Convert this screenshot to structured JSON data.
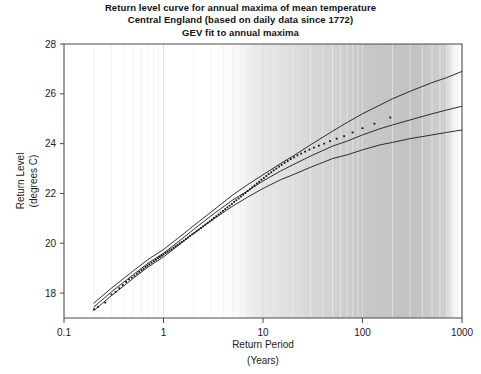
{
  "chart_data": {
    "type": "line",
    "title": "Return level curve for annual maxima of mean temperature",
    "subtitle": "Central England (based on daily data since 1772)",
    "subtitle2": "GEV fit to annual maxima",
    "xlabel": "Return Period",
    "xlabel_units": "(Years)",
    "ylabel_line1": "Return Level",
    "ylabel_line2": "(degrees C)",
    "xscale": "log",
    "xlim": [
      0.1,
      1000
    ],
    "ylim": [
      17,
      28
    ],
    "xticks": [
      0.1,
      1,
      10,
      100,
      1000
    ],
    "xtick_labels": [
      "0.1",
      "1",
      "10",
      "100",
      "1000"
    ],
    "yticks": [
      18,
      20,
      22,
      24,
      26,
      28
    ],
    "ytick_labels": [
      "18",
      "20",
      "22",
      "24",
      "26",
      "28"
    ],
    "grid": "minor-vertical-log",
    "legend": "none",
    "line_color": "#1a1a1a",
    "point_color": "#111111",
    "grid_color": "#e8e8e8",
    "axis_color": "#555555",
    "series": [
      {
        "name": "GEV fit (central estimate)",
        "role": "fit",
        "x": [
          0.2,
          0.3,
          0.5,
          0.7,
          1.0,
          1.5,
          2.0,
          3.0,
          5.0,
          7.0,
          10.0,
          15.0,
          20.0,
          30.0,
          50.0,
          70.0,
          100.0,
          150.0,
          200.0,
          300.0,
          500.0,
          700.0,
          1000.0
        ],
        "y": [
          17.45,
          18.05,
          18.75,
          19.2,
          19.6,
          20.15,
          20.55,
          21.1,
          21.75,
          22.1,
          22.5,
          22.9,
          23.15,
          23.5,
          23.9,
          24.1,
          24.35,
          24.6,
          24.75,
          24.95,
          25.2,
          25.35,
          25.5
        ]
      },
      {
        "name": "Upper 95% confidence limit",
        "role": "upper-ci",
        "x": [
          0.2,
          0.3,
          0.5,
          0.7,
          1.0,
          1.5,
          2.0,
          3.0,
          5.0,
          7.0,
          10.0,
          15.0,
          20.0,
          30.0,
          50.0,
          70.0,
          100.0,
          150.0,
          200.0,
          300.0,
          500.0,
          700.0,
          1000.0
        ],
        "y": [
          17.6,
          18.2,
          18.9,
          19.35,
          19.75,
          20.3,
          20.7,
          21.25,
          21.95,
          22.35,
          22.75,
          23.2,
          23.5,
          23.95,
          24.5,
          24.85,
          25.2,
          25.55,
          25.8,
          26.1,
          26.45,
          26.65,
          26.9
        ]
      },
      {
        "name": "Lower 95% confidence limit",
        "role": "lower-ci",
        "x": [
          0.2,
          0.3,
          0.5,
          0.7,
          1.0,
          1.5,
          2.0,
          3.0,
          5.0,
          7.0,
          10.0,
          15.0,
          20.0,
          30.0,
          50.0,
          70.0,
          100.0,
          150.0,
          200.0,
          300.0,
          500.0,
          700.0,
          1000.0
        ],
        "y": [
          17.3,
          17.9,
          18.6,
          19.05,
          19.45,
          20.0,
          20.4,
          20.9,
          21.5,
          21.85,
          22.2,
          22.55,
          22.75,
          23.05,
          23.4,
          23.55,
          23.75,
          23.95,
          24.05,
          24.2,
          24.35,
          24.45,
          24.55
        ]
      },
      {
        "name": "Observed annual maxima (empirical return levels)",
        "role": "points",
        "x": [
          0.2,
          0.22,
          0.26,
          0.3,
          0.33,
          0.36,
          0.39,
          0.42,
          0.45,
          0.48,
          0.51,
          0.54,
          0.57,
          0.6,
          0.63,
          0.66,
          0.69,
          0.72,
          0.76,
          0.8,
          0.84,
          0.88,
          0.92,
          0.96,
          1.0,
          1.05,
          1.1,
          1.15,
          1.2,
          1.26,
          1.32,
          1.38,
          1.45,
          1.52,
          1.6,
          1.68,
          1.76,
          1.85,
          1.95,
          2.05,
          2.15,
          2.26,
          2.38,
          2.5,
          2.63,
          2.77,
          2.91,
          3.06,
          3.22,
          3.39,
          3.57,
          3.76,
          3.96,
          4.17,
          4.39,
          4.62,
          4.87,
          5.13,
          5.4,
          5.69,
          6.0,
          6.32,
          6.66,
          7.02,
          7.4,
          7.8,
          8.22,
          8.67,
          9.14,
          9.64,
          10.2,
          10.8,
          11.4,
          12.1,
          12.8,
          13.6,
          14.5,
          15.4,
          16.5,
          17.7,
          19.0,
          20.5,
          22.2,
          24.2,
          26.5,
          29.3,
          32.5,
          36.4,
          41.2,
          47.2,
          55.0,
          65.3,
          79.5,
          100.0,
          132.0,
          190.0
        ],
        "y": [
          17.35,
          17.45,
          17.62,
          17.95,
          18.05,
          18.2,
          18.32,
          18.45,
          18.55,
          18.62,
          18.7,
          18.78,
          18.85,
          18.92,
          18.98,
          19.05,
          19.1,
          19.16,
          19.22,
          19.28,
          19.34,
          19.4,
          19.45,
          19.5,
          19.55,
          19.61,
          19.66,
          19.71,
          19.76,
          19.82,
          19.88,
          19.93,
          19.99,
          20.05,
          20.11,
          20.17,
          20.23,
          20.3,
          20.36,
          20.42,
          20.48,
          20.55,
          20.61,
          20.68,
          20.75,
          20.81,
          20.88,
          20.95,
          21.02,
          21.09,
          21.16,
          21.23,
          21.3,
          21.37,
          21.44,
          21.51,
          21.58,
          21.66,
          21.73,
          21.8,
          21.88,
          21.95,
          22.02,
          22.1,
          22.17,
          22.25,
          22.32,
          22.4,
          22.47,
          22.55,
          22.62,
          22.7,
          22.78,
          22.85,
          22.93,
          23.0,
          23.08,
          23.15,
          23.23,
          23.3,
          23.38,
          23.45,
          23.53,
          23.6,
          23.68,
          23.76,
          23.84,
          23.92,
          24.0,
          24.1,
          24.2,
          24.3,
          24.45,
          24.62,
          24.8,
          25.05
        ]
      }
    ]
  }
}
